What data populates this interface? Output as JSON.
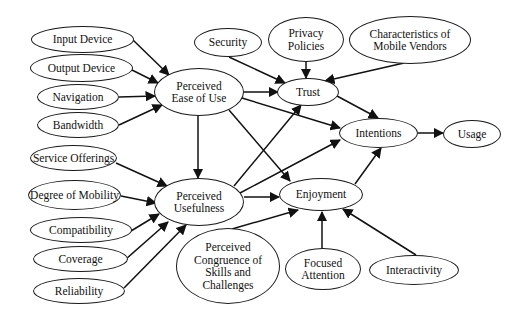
{
  "diagram": {
    "title": "",
    "nodes": [
      {
        "id": "input-device",
        "label": "Input Device",
        "x": 31,
        "y": 26,
        "w": 103,
        "h": 27
      },
      {
        "id": "output-device",
        "label": "Output Device",
        "x": 30,
        "y": 54,
        "w": 103,
        "h": 28
      },
      {
        "id": "navigation",
        "label": "Navigation",
        "x": 37,
        "y": 84,
        "w": 82,
        "h": 26
      },
      {
        "id": "bandwidth",
        "label": "Bandwidth",
        "x": 37,
        "y": 112,
        "w": 82,
        "h": 26
      },
      {
        "id": "peou",
        "label": "Perceived\nEase of Use",
        "x": 154,
        "y": 68,
        "w": 90,
        "h": 48
      },
      {
        "id": "security",
        "label": "Security",
        "x": 194,
        "y": 28,
        "w": 68,
        "h": 29
      },
      {
        "id": "privacy",
        "label": "Privacy\nPolicies",
        "x": 268,
        "y": 17,
        "w": 76,
        "h": 45
      },
      {
        "id": "vendors",
        "label": "Characteristics of\nMobile Vendors",
        "x": 349,
        "y": 16,
        "w": 122,
        "h": 48
      },
      {
        "id": "trust",
        "label": "Trust",
        "x": 277,
        "y": 78,
        "w": 62,
        "h": 28
      },
      {
        "id": "intentions",
        "label": "Intentions",
        "x": 339,
        "y": 118,
        "w": 79,
        "h": 30
      },
      {
        "id": "usage",
        "label": "Usage",
        "x": 443,
        "y": 120,
        "w": 58,
        "h": 28
      },
      {
        "id": "service",
        "label": "Service Offerings",
        "x": 30,
        "y": 145,
        "w": 87,
        "h": 26
      },
      {
        "id": "mobility",
        "label": "Degree of Mobility",
        "x": 28,
        "y": 180,
        "w": 93,
        "h": 30
      },
      {
        "id": "compat",
        "label": "Compatibility",
        "x": 30,
        "y": 217,
        "w": 102,
        "h": 26
      },
      {
        "id": "coverage",
        "label": "Coverage",
        "x": 33,
        "y": 246,
        "w": 95,
        "h": 26
      },
      {
        "id": "reliability",
        "label": "Reliability",
        "x": 33,
        "y": 278,
        "w": 92,
        "h": 26
      },
      {
        "id": "pu",
        "label": "Perceived\nUsefulness",
        "x": 154,
        "y": 178,
        "w": 90,
        "h": 48
      },
      {
        "id": "enjoyment",
        "label": "Enjoyment",
        "x": 279,
        "y": 178,
        "w": 84,
        "h": 33
      },
      {
        "id": "congruence",
        "label": "Perceived\nCongruence of\nSkills and\nChallenges",
        "x": 176,
        "y": 228,
        "w": 104,
        "h": 76
      },
      {
        "id": "focused",
        "label": "Focused\nAttention",
        "x": 285,
        "y": 248,
        "w": 76,
        "h": 42
      },
      {
        "id": "interactivity",
        "label": "Interactivity",
        "x": 369,
        "y": 255,
        "w": 90,
        "h": 30
      }
    ],
    "edges": [
      {
        "from": "input-device",
        "to": "peou",
        "x1": 133,
        "y1": 40,
        "x2": 169,
        "y2": 75
      },
      {
        "from": "output-device",
        "to": "peou",
        "x1": 132,
        "y1": 70,
        "x2": 158,
        "y2": 83
      },
      {
        "from": "navigation",
        "to": "peou",
        "x1": 119,
        "y1": 97,
        "x2": 155,
        "y2": 96
      },
      {
        "from": "bandwidth",
        "to": "peou",
        "x1": 119,
        "y1": 125,
        "x2": 162,
        "y2": 105
      },
      {
        "from": "peou",
        "to": "trust",
        "x1": 244,
        "y1": 92,
        "x2": 278,
        "y2": 92
      },
      {
        "from": "peou",
        "to": "intentions",
        "x1": 242,
        "y1": 98,
        "x2": 340,
        "y2": 128
      },
      {
        "from": "peou",
        "to": "pu",
        "x1": 198,
        "y1": 116,
        "x2": 198,
        "y2": 178
      },
      {
        "from": "peou",
        "to": "enjoyment",
        "x1": 229,
        "y1": 110,
        "x2": 290,
        "y2": 181
      },
      {
        "from": "security",
        "to": "trust",
        "x1": 229,
        "y1": 57,
        "x2": 285,
        "y2": 83
      },
      {
        "from": "privacy",
        "to": "trust",
        "x1": 306,
        "y1": 62,
        "x2": 306,
        "y2": 78
      },
      {
        "from": "vendors",
        "to": "trust",
        "x1": 404,
        "y1": 63,
        "x2": 325,
        "y2": 81
      },
      {
        "from": "trust",
        "to": "intentions",
        "x1": 337,
        "y1": 96,
        "x2": 378,
        "y2": 118
      },
      {
        "from": "intentions",
        "to": "usage",
        "x1": 418,
        "y1": 133,
        "x2": 443,
        "y2": 133
      },
      {
        "from": "pu",
        "to": "trust",
        "x1": 234,
        "y1": 186,
        "x2": 301,
        "y2": 105
      },
      {
        "from": "pu",
        "to": "intentions",
        "x1": 240,
        "y1": 193,
        "x2": 340,
        "y2": 140
      },
      {
        "from": "pu",
        "to": "enjoyment",
        "x1": 244,
        "y1": 197,
        "x2": 279,
        "y2": 197
      },
      {
        "from": "enjoyment",
        "to": "intentions",
        "x1": 355,
        "y1": 184,
        "x2": 381,
        "y2": 148
      },
      {
        "from": "service",
        "to": "pu",
        "x1": 116,
        "y1": 163,
        "x2": 167,
        "y2": 186
      },
      {
        "from": "mobility",
        "to": "pu",
        "x1": 121,
        "y1": 196,
        "x2": 156,
        "y2": 203
      },
      {
        "from": "compat",
        "to": "pu",
        "x1": 131,
        "y1": 231,
        "x2": 159,
        "y2": 214
      },
      {
        "from": "coverage",
        "to": "pu",
        "x1": 126,
        "y1": 259,
        "x2": 168,
        "y2": 222
      },
      {
        "from": "reliability",
        "to": "pu",
        "x1": 124,
        "y1": 288,
        "x2": 186,
        "y2": 225
      },
      {
        "from": "congruence",
        "to": "enjoyment",
        "x1": 232,
        "y1": 229,
        "x2": 298,
        "y2": 210
      },
      {
        "from": "focused",
        "to": "enjoyment",
        "x1": 322,
        "y1": 248,
        "x2": 322,
        "y2": 212
      },
      {
        "from": "interactivity",
        "to": "enjoyment",
        "x1": 416,
        "y1": 255,
        "x2": 343,
        "y2": 209
      }
    ]
  }
}
